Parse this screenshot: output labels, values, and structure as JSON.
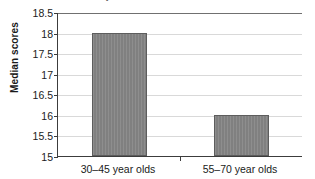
{
  "chart_data": {
    "type": "bar",
    "title": "",
    "title_fragment_visible": "y",
    "categories": [
      "30–45 year olds",
      "55–70 year olds"
    ],
    "values": [
      18,
      16
    ],
    "xlabel": "",
    "ylabel": "Median scores",
    "ylim": [
      15,
      18.5
    ],
    "ytick_values": [
      18.5,
      18,
      17.5,
      17,
      16.5,
      16,
      15.5,
      15
    ],
    "ytick_labels": [
      "18.5",
      "18",
      "17.5",
      "17",
      "16.5",
      "16",
      "15.5",
      "15"
    ],
    "ytick_step": 0.5,
    "grid": true,
    "grid_axis": "y",
    "legend": false,
    "legend_position": "none",
    "bar_color": "#808080",
    "bar_edge_color": "#5d5d5d",
    "grid_color": "#d9d9d9",
    "axis_color": "#3c3c3c",
    "background_color": "#ffffff",
    "text_color": "#1a1a1a"
  }
}
